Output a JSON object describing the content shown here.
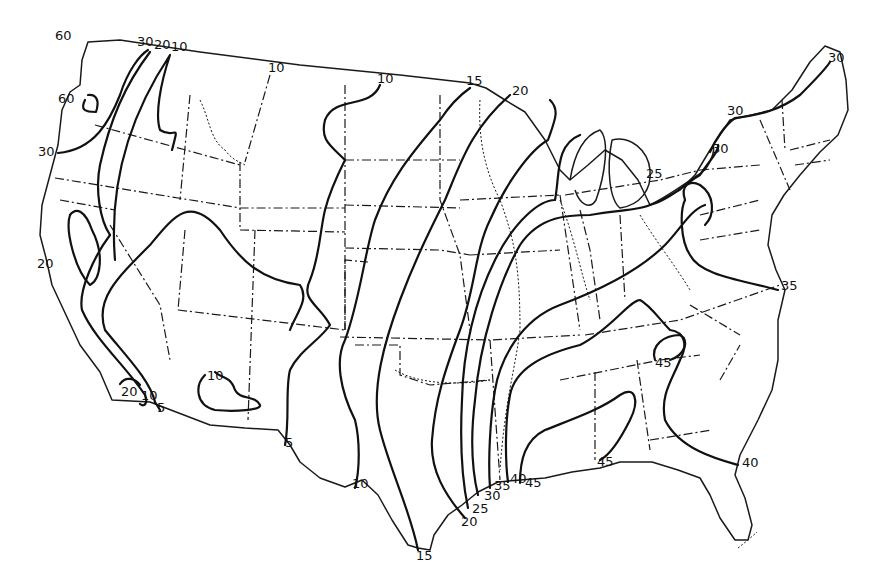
{
  "map": {
    "title": "",
    "subject": "Contiguous United States isopleth map",
    "line_color": "#111111",
    "background": "#ffffff",
    "isoline_labels": [
      {
        "id": "wa-60-top",
        "text": "60",
        "x": 55,
        "y": 40
      },
      {
        "id": "wa-60-coast",
        "text": "60",
        "x": 58,
        "y": 103
      },
      {
        "id": "or-30-coast",
        "text": "30",
        "x": 38,
        "y": 156
      },
      {
        "id": "nw-30",
        "text": "30",
        "x": 137,
        "y": 46
      },
      {
        "id": "nw-20",
        "text": "20",
        "x": 154,
        "y": 49
      },
      {
        "id": "nw-10",
        "text": "10",
        "x": 171,
        "y": 51
      },
      {
        "id": "mt-10",
        "text": "10",
        "x": 268,
        "y": 72
      },
      {
        "id": "nd-10",
        "text": "10",
        "x": 377,
        "y": 83
      },
      {
        "id": "mn-15",
        "text": "15",
        "x": 466,
        "y": 85
      },
      {
        "id": "wi-20",
        "text": "20",
        "x": 512,
        "y": 95
      },
      {
        "id": "ca-20-coast",
        "text": "20",
        "x": 37,
        "y": 268
      },
      {
        "id": "ca-20-south",
        "text": "20",
        "x": 121,
        "y": 396
      },
      {
        "id": "ca-10-south",
        "text": "10",
        "x": 141,
        "y": 400
      },
      {
        "id": "ca-5-south",
        "text": "5",
        "x": 157,
        "y": 412
      },
      {
        "id": "az-10",
        "text": "10",
        "x": 207,
        "y": 380
      },
      {
        "id": "tx-5",
        "text": "5",
        "x": 285,
        "y": 447
      },
      {
        "id": "tx-10",
        "text": "10",
        "x": 352,
        "y": 488
      },
      {
        "id": "tx-15",
        "text": "15",
        "x": 416,
        "y": 560
      },
      {
        "id": "tx-20",
        "text": "20",
        "x": 461,
        "y": 526
      },
      {
        "id": "tx-25",
        "text": "25",
        "x": 472,
        "y": 513
      },
      {
        "id": "tx-30",
        "text": "30",
        "x": 484,
        "y": 500
      },
      {
        "id": "la-35",
        "text": "35",
        "x": 494,
        "y": 490
      },
      {
        "id": "la-40",
        "text": "40",
        "x": 510,
        "y": 483
      },
      {
        "id": "la-45",
        "text": "45",
        "x": 525,
        "y": 487
      },
      {
        "id": "mi-25",
        "text": "25",
        "x": 646,
        "y": 178
      },
      {
        "id": "ny-30-west",
        "text": "30",
        "x": 712,
        "y": 153
      },
      {
        "id": "ny-30-north",
        "text": "30",
        "x": 727,
        "y": 115
      },
      {
        "id": "me-30",
        "text": "30",
        "x": 828,
        "y": 62
      },
      {
        "id": "nc-35",
        "text": "35",
        "x": 781,
        "y": 290
      },
      {
        "id": "ga-45",
        "text": "45",
        "x": 655,
        "y": 367
      },
      {
        "id": "ms-45",
        "text": "45",
        "x": 597,
        "y": 466
      },
      {
        "id": "fl-40",
        "text": "40",
        "x": 742,
        "y": 467
      }
    ],
    "cropped_top_text": "",
    "cropped_bottom_text": ""
  }
}
